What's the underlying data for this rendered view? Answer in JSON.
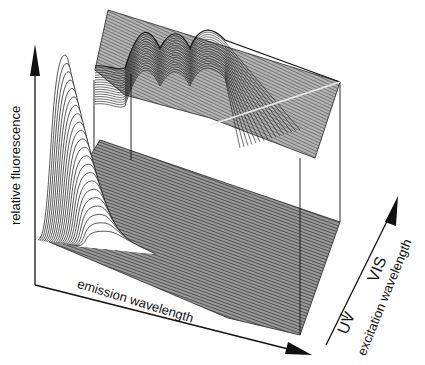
{
  "chart_data": {
    "type": "surface3d",
    "title": "",
    "xlabel": "emission wavelength",
    "ylabel": "relative fluorescence",
    "zlabel": "excitation wavelength",
    "z_tick_labels": [
      "UV",
      "VIS"
    ],
    "grid": false,
    "legend": null,
    "series": [
      {
        "name": "front UV peak",
        "note": "tall single emission peak at short emission wavelength, UV excitation",
        "relative_height": 1.0
      },
      {
        "name": "back VIS peaks",
        "note": "several smaller peaks (about 3) at longer excitation wavelength",
        "relative_height": 0.45
      }
    ],
    "colors": {
      "line": "#111111",
      "background": "#ffffff",
      "plane": "#555555"
    }
  },
  "labels": {
    "y_axis": "relative fluorescence",
    "x_axis": "emission wavelength",
    "z_axis": "excitation wavelength",
    "z_tick_uv": "UV",
    "z_tick_vis": "VIS"
  }
}
